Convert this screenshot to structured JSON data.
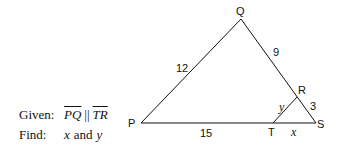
{
  "problem": {
    "given_label": "Given:",
    "given_seg1": "PQ",
    "given_parallel": "||",
    "given_seg2": "TR",
    "find_label": "Find:",
    "find_x": "x",
    "find_and": "and",
    "find_y": "y"
  },
  "diagram": {
    "vertices": {
      "P": "P",
      "Q": "Q",
      "R": "R",
      "S": "S",
      "T": "T"
    },
    "sides": {
      "PQ": "12",
      "QR": "9",
      "RS": "3",
      "PT": "15",
      "TS": "x",
      "TR": "y"
    },
    "color": "#111111"
  }
}
